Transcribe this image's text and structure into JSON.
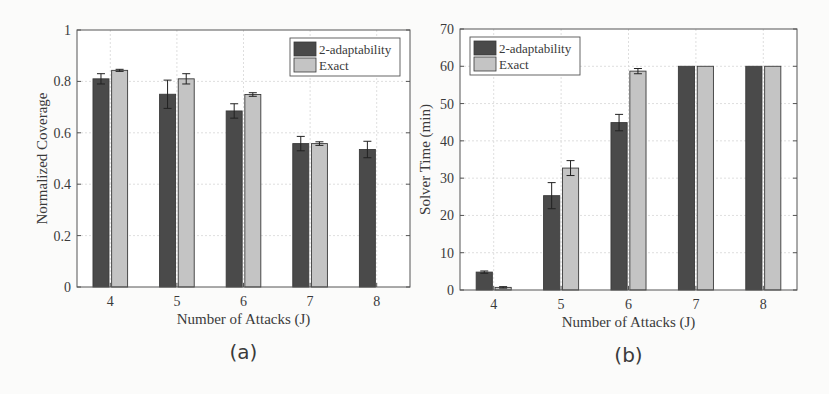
{
  "chart_data": [
    {
      "type": "bar",
      "panel_label": "(a)",
      "title": "",
      "xlabel": "Number of Attacks (J)",
      "ylabel": "Normalized Coverage",
      "categories": [
        "4",
        "5",
        "6",
        "7",
        "8"
      ],
      "ylim": [
        0,
        1
      ],
      "yticks": [
        "0",
        "0.2",
        "0.4",
        "0.6",
        "0.8",
        "1"
      ],
      "grid": true,
      "legend_position": "top-right",
      "series": [
        {
          "name": "2-adaptability",
          "color": "#4a4a4a",
          "values": [
            0.81,
            0.75,
            0.685,
            0.558,
            0.535
          ],
          "errors": [
            0.02,
            0.055,
            0.028,
            0.028,
            0.032
          ]
        },
        {
          "name": "Exact",
          "color": "#c4c4c4",
          "values": [
            0.843,
            0.81,
            0.749,
            0.558,
            null
          ],
          "errors": [
            0.004,
            0.02,
            0.007,
            0.007,
            null
          ]
        }
      ]
    },
    {
      "type": "bar",
      "panel_label": "(b)",
      "title": "",
      "xlabel": "Number of Attacks (J)",
      "ylabel": "Solver Time (min)",
      "categories": [
        "4",
        "5",
        "6",
        "7",
        "8"
      ],
      "ylim": [
        0,
        70
      ],
      "yticks": [
        "0",
        "10",
        "20",
        "30",
        "40",
        "50",
        "60",
        "70"
      ],
      "grid": true,
      "legend_position": "top-left",
      "series": [
        {
          "name": "2-adaptability",
          "color": "#4a4a4a",
          "values": [
            4.8,
            25.3,
            44.9,
            60,
            60
          ],
          "errors": [
            0.3,
            3.5,
            2.2,
            0,
            0
          ]
        },
        {
          "name": "Exact",
          "color": "#c4c4c4",
          "values": [
            0.7,
            32.7,
            58.7,
            60,
            60
          ],
          "errors": [
            0.2,
            2.0,
            0.7,
            0,
            0
          ]
        }
      ]
    }
  ]
}
